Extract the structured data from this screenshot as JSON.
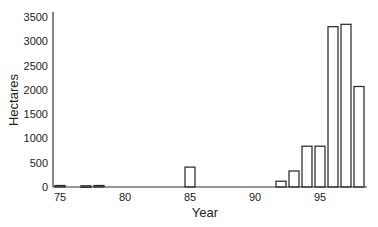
{
  "chart_data": {
    "type": "bar",
    "title": "",
    "xlabel": "Year",
    "ylabel": "Hectares",
    "ylim": [
      0,
      3500
    ],
    "xlim": [
      74.5,
      98.5
    ],
    "yticks": [
      0,
      500,
      1000,
      1500,
      2000,
      2500,
      3000,
      3500
    ],
    "xticks": [
      75,
      80,
      85,
      90,
      95
    ],
    "grid": false,
    "legend": null,
    "categories": [
      75,
      77,
      78,
      85,
      92,
      93,
      94,
      95,
      96,
      97,
      98
    ],
    "values": [
      30,
      25,
      30,
      410,
      120,
      330,
      840,
      840,
      3300,
      3350,
      2070
    ],
    "bar_fill": "#ffffff",
    "bar_stroke": "#222222"
  }
}
